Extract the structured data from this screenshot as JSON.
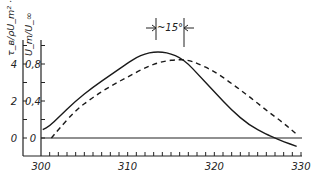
{
  "chart_data": {
    "type": "line",
    "title": "",
    "xlabel": "",
    "ylabel_left": "τ_в/ρU_m² · 10³",
    "ylabel_inner": "U_m/U_∞",
    "x_ticks": [
      "300",
      "310",
      "320",
      "330"
    ],
    "y_ticks_left": [
      "0",
      "2",
      "4"
    ],
    "y_ticks_inner": [
      "0",
      "0,4",
      "0,8"
    ],
    "xlim": [
      300,
      330
    ],
    "ylim_left": [
      -0.9,
      5.5
    ],
    "ylim_inner": [
      -0.18,
      1.1
    ],
    "annotation": "~15°",
    "grid": false,
    "series": [
      {
        "name": "τ_в/ρU_m² · 10³ (solid)",
        "style": "solid",
        "x": [
          300.2,
          301,
          302,
          304,
          306,
          308,
          310,
          311,
          312,
          313,
          314,
          315,
          316,
          317,
          318,
          320,
          322,
          324,
          326,
          327,
          328,
          329.5
        ],
        "y": [
          0.45,
          0.65,
          1.1,
          2.0,
          2.75,
          3.4,
          4.05,
          4.35,
          4.55,
          4.65,
          4.65,
          4.55,
          4.35,
          4.0,
          3.5,
          2.5,
          1.5,
          0.7,
          0.2,
          0.0,
          -0.2,
          -0.45
        ]
      },
      {
        "name": "U_m/U_∞ (dashed)",
        "style": "dashed",
        "x": [
          301.2,
          302,
          304,
          306,
          308,
          310,
          312,
          314,
          316,
          317,
          318,
          320,
          322,
          324,
          326,
          328,
          329.5
        ],
        "y": [
          0.0,
          0.09,
          0.3,
          0.44,
          0.56,
          0.66,
          0.76,
          0.83,
          0.85,
          0.84,
          0.81,
          0.72,
          0.59,
          0.45,
          0.3,
          0.16,
          0.04
        ]
      }
    ]
  }
}
